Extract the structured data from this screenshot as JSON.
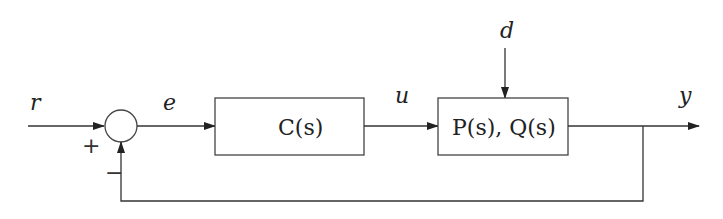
{
  "diagram": {
    "type": "feedback-control-block-diagram",
    "signals": {
      "reference": "r",
      "error": "e",
      "control": "u",
      "disturbance": "d",
      "output": "y"
    },
    "blocks": {
      "controller": "C(s)",
      "plant": "P(s), Q(s)"
    },
    "summing_junction": {
      "plus_sign": "+",
      "minus_sign": "−"
    },
    "colors": {
      "line": "#333333",
      "text": "#222222"
    }
  }
}
